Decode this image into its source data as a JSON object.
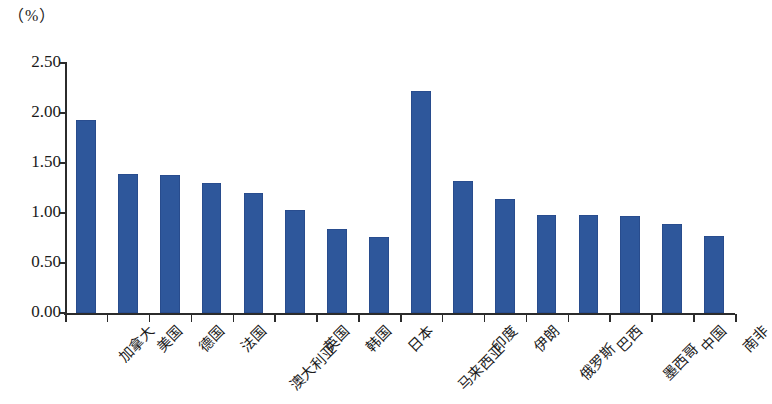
{
  "chart_data": {
    "type": "bar",
    "title": "",
    "subtitle": "",
    "xlabel": "",
    "ylabel": "（%）",
    "unit_label": "（%）",
    "ylim": [
      0.0,
      2.5
    ],
    "ytick_labels": [
      "0.00",
      "0.50",
      "1.00",
      "1.50",
      "2.00",
      "2.50"
    ],
    "ytick_values": [
      0.0,
      0.5,
      1.0,
      1.5,
      2.0,
      2.5
    ],
    "grid": false,
    "legend": null,
    "legend_position": "none",
    "series_color": "#2e579b",
    "axis_color": "#2b2b2b",
    "categories": [
      "加拿大",
      "美国",
      "德国",
      "法国",
      "澳大利亚",
      "英国",
      "韩国",
      "日本",
      "马来西亚",
      "印度",
      "伊朗",
      "俄罗斯",
      "巴西",
      "墨西哥",
      "中国",
      "南非"
    ],
    "category_label_rows": [
      0,
      0,
      0,
      0,
      1,
      0,
      0,
      0,
      1,
      0,
      0,
      1,
      0,
      1,
      0,
      0
    ],
    "values": [
      1.93,
      1.39,
      1.38,
      1.3,
      1.2,
      1.03,
      0.84,
      0.76,
      2.22,
      1.32,
      1.14,
      0.98,
      0.98,
      0.97,
      0.89,
      0.77
    ]
  }
}
